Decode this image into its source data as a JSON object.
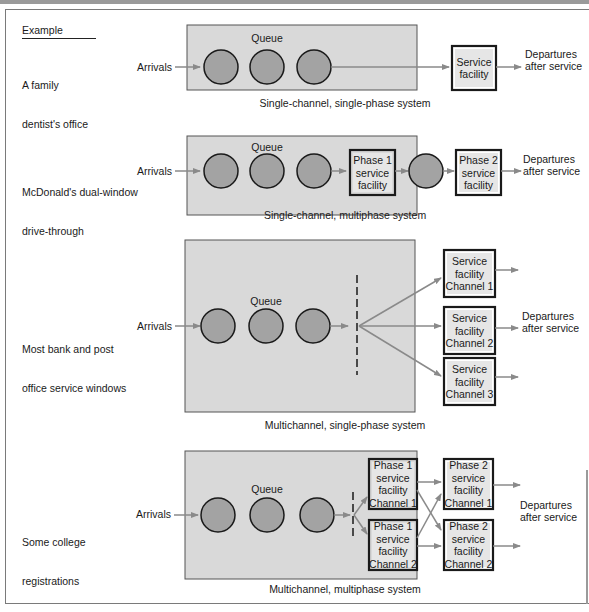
{
  "header": {
    "example_label": "Example"
  },
  "common": {
    "arrivals": "Arrivals",
    "queue": "Queue",
    "departures": [
      "Departures",
      "after service"
    ]
  },
  "colors": {
    "panel_fill": "#d9d9d9",
    "customer_fill": "#a3a3a3",
    "facility_fill": "#e6e6e6",
    "arrow": "#8a8a8a",
    "outline": "#1a1a1a"
  },
  "systems": [
    {
      "example": [
        "A family",
        "dentist's office"
      ],
      "caption": "Single-channel, single-phase system",
      "facilities": [
        {
          "lines": [
            "Service",
            "facility"
          ]
        }
      ]
    },
    {
      "example": [
        "McDonald's dual-window",
        "drive-through"
      ],
      "caption": "Single-channel, multiphase system",
      "facilities": [
        {
          "lines": [
            "Phase 1",
            "service",
            "facility"
          ]
        },
        {
          "lines": [
            "Phase 2",
            "service",
            "facility"
          ]
        }
      ]
    },
    {
      "example": [
        "Most bank and post",
        "office service windows"
      ],
      "caption": "Multichannel, single-phase system",
      "facilities": [
        {
          "lines": [
            "Service",
            "facility",
            "Channel 1"
          ]
        },
        {
          "lines": [
            "Service",
            "facility",
            "Channel 2"
          ]
        },
        {
          "lines": [
            "Service",
            "facility",
            "Channel 3"
          ]
        }
      ]
    },
    {
      "example": [
        "Some college",
        "registrations"
      ],
      "caption": "Multichannel, multiphase system",
      "facilities": [
        {
          "lines": [
            "Phase 1",
            "service",
            "facility",
            "Channel 1"
          ]
        },
        {
          "lines": [
            "Phase 1",
            "service",
            "facility",
            "Channel 2"
          ]
        },
        {
          "lines": [
            "Phase 2",
            "service",
            "facility",
            "Channel 1"
          ]
        },
        {
          "lines": [
            "Phase 2",
            "service",
            "facility",
            "Channel 2"
          ]
        }
      ]
    }
  ]
}
